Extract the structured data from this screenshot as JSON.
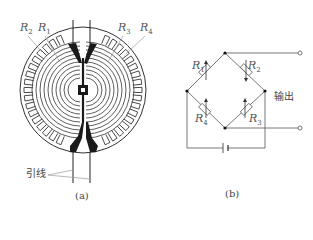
{
  "figure_a": {
    "caption": "(a)",
    "labels": {
      "R2": {
        "base": "R",
        "sub": "2"
      },
      "R1": {
        "base": "R",
        "sub": "1"
      },
      "R3": {
        "base": "R",
        "sub": "3"
      },
      "R4": {
        "base": "R",
        "sub": "4"
      }
    },
    "lead_label": "引线",
    "description": "Circular (rosette) foil strain gauge with four grid resistors R1–R4 and lead wires"
  },
  "figure_b": {
    "caption": "(b)",
    "labels": {
      "R1": {
        "base": "R",
        "sub": "1"
      },
      "R2": {
        "base": "R",
        "sub": "2"
      },
      "R3": {
        "base": "R",
        "sub": "3"
      },
      "R4": {
        "base": "R",
        "sub": "4"
      }
    },
    "output_label": "输出",
    "description": "Wheatstone bridge with four variable resistors, DC supply and output terminals"
  },
  "colors": {
    "stroke": "#333333",
    "fill_dark": "#1a1a1a",
    "leader": "#999999",
    "text": "#555555"
  }
}
